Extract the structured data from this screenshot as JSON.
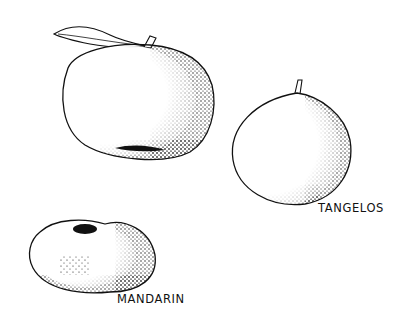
{
  "illustration": {
    "style": "black-and-white stipple line drawing",
    "colors": {
      "ink": "#111111",
      "paper": "#ffffff"
    },
    "fruits": [
      {
        "name": "orange-with-leaf",
        "label": ""
      },
      {
        "name": "tangelo",
        "label": "TANGELOS"
      },
      {
        "name": "mandarin",
        "label": "MANDARIN"
      }
    ]
  }
}
